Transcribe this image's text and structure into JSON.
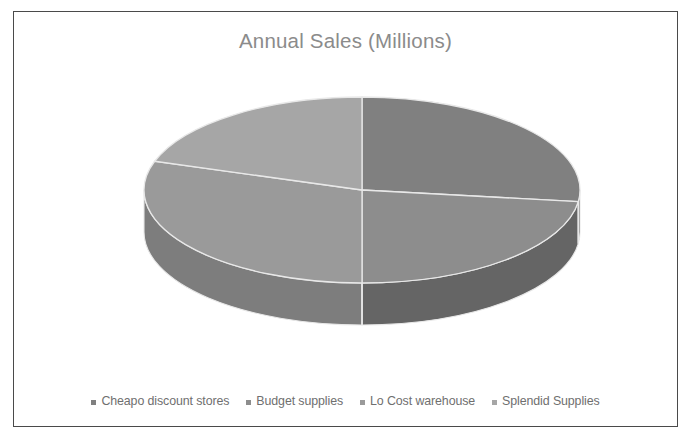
{
  "chart_data": {
    "type": "pie",
    "title": "Annual Sales (Millions)",
    "three_d": true,
    "categories": [
      "Cheapo discount stores",
      "Budget supplies",
      "Lo Cost warehouse",
      "Splendid Supplies"
    ],
    "values": [
      27,
      23,
      30,
      20
    ],
    "units": "Millions",
    "legend_position": "bottom",
    "grid": false,
    "xlabel": "",
    "ylabel": "",
    "colors": [
      "#808080",
      "#8d8d8d",
      "#9a9a9a",
      "#a6a6a6"
    ],
    "side_colors": [
      "#5c5c5c",
      "#656565",
      "#7d7d7d",
      "#8a8a8a"
    ],
    "slice_edge_color": "#e8e8e8",
    "background": "#ffffff",
    "border_color": "#4a4a4a",
    "title_color": "#8b8b8b",
    "legend_text_color": "#6f6f6f",
    "slices": [
      {
        "label": "Cheapo discount stores",
        "value": 27,
        "percent": "27%",
        "color": "#808080",
        "side_color": "#5c5c5c"
      },
      {
        "label": "Budget supplies",
        "value": 23,
        "percent": "23%",
        "color": "#8d8d8d",
        "side_color": "#656565"
      },
      {
        "label": "Lo Cost warehouse",
        "value": 30,
        "percent": "30%",
        "color": "#9a9a9a",
        "side_color": "#7d7d7d"
      },
      {
        "label": "Splendid Supplies",
        "value": 20,
        "percent": "20%",
        "color": "#a6a6a6",
        "side_color": "#8a8a8a"
      }
    ]
  },
  "chart": {
    "title": "Annual Sales (Millions)"
  },
  "legend": {
    "items": [
      {
        "label": "Cheapo discount stores"
      },
      {
        "label": "Budget supplies"
      },
      {
        "label": "Lo Cost warehouse"
      },
      {
        "label": "Splendid Supplies"
      }
    ]
  }
}
